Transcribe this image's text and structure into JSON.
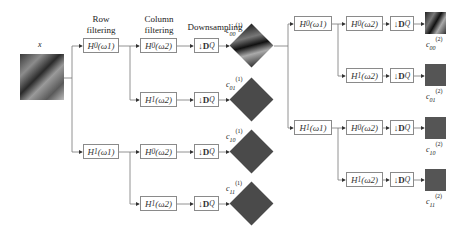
{
  "input_label": "x",
  "headers": {
    "row_filtering": "Row filtering",
    "column_filtering": "Column filtering",
    "downsampling": "Downsampling"
  },
  "level1": {
    "row_filters": [
      {
        "name": "H0",
        "sub": "0",
        "arg": "(ω1)"
      },
      {
        "name": "H1",
        "sub": "1",
        "arg": "(ω1)"
      }
    ],
    "col_filters": [
      {
        "label": "H0(ω2)",
        "sub": "0"
      },
      {
        "label": "H1(ω2)",
        "sub": "1"
      },
      {
        "label": "H0(ω2)",
        "sub": "0"
      },
      {
        "label": "H1(ω2)",
        "sub": "1"
      }
    ],
    "downsample_label": "↓D",
    "downsample_sub": "Q",
    "outputs": [
      {
        "base": "c",
        "sub": "00",
        "sup": "(1)"
      },
      {
        "base": "c",
        "sub": "01",
        "sup": "(1)"
      },
      {
        "base": "c",
        "sub": "10",
        "sup": "(1)"
      },
      {
        "base": "c",
        "sub": "11",
        "sup": "(1)"
      }
    ]
  },
  "level2": {
    "row_filters": [
      {
        "sub": "0",
        "arg": "(ω1)"
      },
      {
        "sub": "1",
        "arg": "(ω1)"
      }
    ],
    "col_filters": [
      {
        "sub": "0",
        "arg": "(ω2)"
      },
      {
        "sub": "1",
        "arg": "(ω2)"
      },
      {
        "sub": "0",
        "arg": "(ω2)"
      },
      {
        "sub": "1",
        "arg": "(ω2)"
      }
    ],
    "outputs": [
      {
        "base": "c",
        "sub": "00",
        "sup": "(2)"
      },
      {
        "base": "c",
        "sub": "01",
        "sup": "(2)"
      },
      {
        "base": "c",
        "sub": "10",
        "sup": "(2)"
      },
      {
        "base": "c",
        "sub": "11",
        "sup": "(2)"
      }
    ]
  },
  "filter_symbol": "H",
  "colors": {
    "line": "#777777",
    "box_border": "#8a8a8a",
    "subband": "#4a4a4a"
  }
}
